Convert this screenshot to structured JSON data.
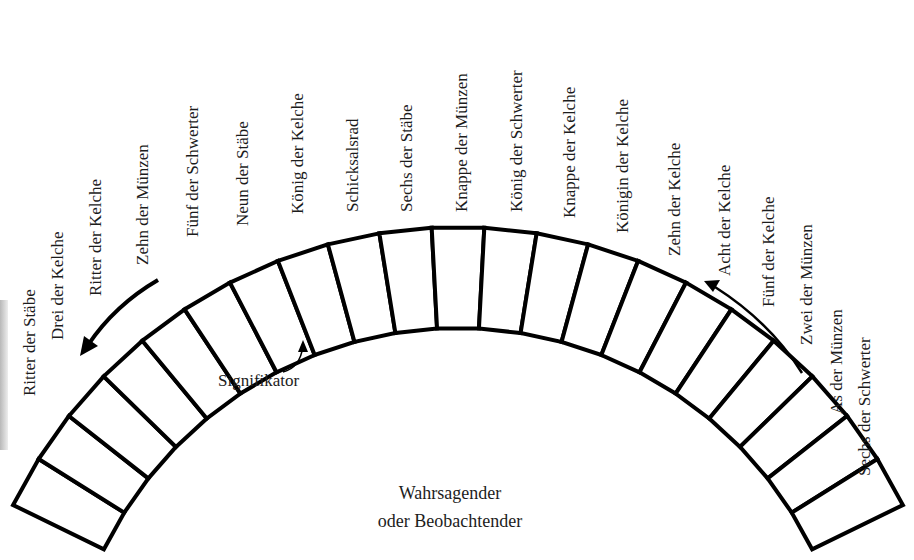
{
  "diagram": {
    "type": "tarot-spread-arc",
    "card_labels": [
      {
        "label": "Ritter der Stäbe",
        "x": 21,
        "y": 396
      },
      {
        "label": "Drei der Kelche",
        "x": 49,
        "y": 340
      },
      {
        "label": "Ritter der Kelche",
        "x": 87,
        "y": 296
      },
      {
        "label": "Zehn der Münzen",
        "x": 134,
        "y": 265
      },
      {
        "label": "Fünf der Schwerter",
        "x": 184,
        "y": 237
      },
      {
        "label": "Neun der Stäbe",
        "x": 234,
        "y": 226
      },
      {
        "label": "König der Kelche",
        "x": 289,
        "y": 214
      },
      {
        "label": "Schicksalsrad",
        "x": 344,
        "y": 212
      },
      {
        "label": "Sechs der Stäbe",
        "x": 398,
        "y": 212
      },
      {
        "label": "Knappe der Münzen",
        "x": 453,
        "y": 212
      },
      {
        "label": "König der Schwerter",
        "x": 508,
        "y": 212
      },
      {
        "label": "Knappe der Kelche",
        "x": 561,
        "y": 218
      },
      {
        "label": "Königin der Kelche",
        "x": 614,
        "y": 233
      },
      {
        "label": "Zehn der Kelche",
        "x": 666,
        "y": 256
      },
      {
        "label": "Acht der Kelche",
        "x": 716,
        "y": 276
      },
      {
        "label": "Fünf der Kelche",
        "x": 760,
        "y": 307
      },
      {
        "label": "Zwei der Münzen",
        "x": 798,
        "y": 345
      },
      {
        "label": "As der Münzen",
        "x": 828,
        "y": 414
      },
      {
        "label": "Sechs der Schwerter",
        "x": 856,
        "y": 476
      }
    ],
    "signifikator_label": "Signifikator",
    "center_label_line1": "Wahrsagender",
    "center_label_line2": "oder Beobachtender",
    "box_count": 21,
    "colors": {
      "stroke": "#000000",
      "background": "#ffffff",
      "text": "#1c1c1c"
    }
  }
}
